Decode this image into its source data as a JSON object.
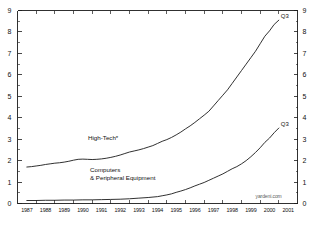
{
  "chart_data": {
    "type": "line",
    "title": "",
    "subtitle": "",
    "xlabel": "",
    "ylabel": "",
    "xlim": [
      1986.5,
      2001.5
    ],
    "ylim": [
      0,
      9
    ],
    "grid": false,
    "legend_position": "inline-annotations",
    "y_ticks": [
      "0",
      "1",
      "2",
      "3",
      "4",
      "5",
      "6",
      "7",
      "8",
      "9"
    ],
    "y_ticks_right": [
      "0",
      "1",
      "2",
      "3",
      "4",
      "5",
      "6",
      "7",
      "8",
      "9"
    ],
    "x_tick_labels": [
      "1987",
      "1988",
      "1989",
      "1990",
      "1991",
      "1992",
      "1993",
      "1994",
      "1995",
      "1996",
      "1997",
      "1998",
      "1999",
      "2000",
      "2001"
    ],
    "series": [
      {
        "name": "High-Tech*",
        "label_text": "High-Tech*",
        "end_label": "Q3",
        "color": "#1a1a1a",
        "x": [
          1987.0,
          1987.25,
          1987.5,
          1987.75,
          1988.0,
          1988.25,
          1988.5,
          1988.75,
          1989.0,
          1989.25,
          1989.5,
          1989.75,
          1990.0,
          1990.25,
          1990.5,
          1990.75,
          1991.0,
          1991.25,
          1991.5,
          1991.75,
          1992.0,
          1992.25,
          1992.5,
          1992.75,
          1993.0,
          1993.25,
          1993.5,
          1993.75,
          1994.0,
          1994.25,
          1994.5,
          1994.75,
          1995.0,
          1995.25,
          1995.5,
          1995.75,
          1996.0,
          1996.25,
          1996.5,
          1996.75,
          1997.0,
          1997.25,
          1997.5,
          1997.75,
          1998.0,
          1998.25,
          1998.5,
          1998.75,
          1999.0,
          1999.25,
          1999.5,
          1999.75,
          2000.0,
          2000.25,
          2000.5
        ],
        "values": [
          1.7,
          1.72,
          1.75,
          1.78,
          1.82,
          1.85,
          1.88,
          1.9,
          1.93,
          1.97,
          2.02,
          2.06,
          2.07,
          2.06,
          2.05,
          2.06,
          2.08,
          2.11,
          2.15,
          2.2,
          2.26,
          2.33,
          2.4,
          2.45,
          2.5,
          2.56,
          2.63,
          2.7,
          2.8,
          2.9,
          2.98,
          3.08,
          3.2,
          3.33,
          3.48,
          3.62,
          3.78,
          3.95,
          4.12,
          4.3,
          4.55,
          4.8,
          5.05,
          5.3,
          5.6,
          5.9,
          6.2,
          6.5,
          6.8,
          7.1,
          7.45,
          7.8,
          8.05,
          8.35,
          8.55
        ]
      },
      {
        "name": "Computers & Peripheral Equipment",
        "label_text": "Computers\n& Peripheral Equipment",
        "label_line1": "Computers",
        "label_line2": "& Peripheral Equipment",
        "end_label": "Q3",
        "color": "#1a1a1a",
        "x": [
          1987.0,
          1987.5,
          1988.0,
          1988.5,
          1989.0,
          1989.5,
          1990.0,
          1990.5,
          1991.0,
          1991.5,
          1992.0,
          1992.5,
          1993.0,
          1993.5,
          1994.0,
          1994.25,
          1994.5,
          1994.75,
          1995.0,
          1995.25,
          1995.5,
          1995.75,
          1996.0,
          1996.25,
          1996.5,
          1996.75,
          1997.0,
          1997.25,
          1997.5,
          1997.75,
          1998.0,
          1998.25,
          1998.5,
          1998.75,
          1999.0,
          1999.25,
          1999.5,
          1999.75,
          2000.0,
          2000.25,
          2000.5
        ],
        "values": [
          0.14,
          0.14,
          0.15,
          0.15,
          0.16,
          0.16,
          0.17,
          0.17,
          0.18,
          0.19,
          0.2,
          0.22,
          0.25,
          0.28,
          0.32,
          0.36,
          0.4,
          0.45,
          0.52,
          0.58,
          0.65,
          0.73,
          0.82,
          0.9,
          0.98,
          1.08,
          1.18,
          1.28,
          1.38,
          1.5,
          1.62,
          1.72,
          1.85,
          2.0,
          2.18,
          2.38,
          2.6,
          2.85,
          3.05,
          3.3,
          3.52
        ]
      }
    ],
    "annotations": [
      {
        "name": "hightech-q3",
        "text": "Q3",
        "x": 2000.5,
        "y": 8.55
      },
      {
        "name": "computers-q3",
        "text": "Q3",
        "x": 2000.5,
        "y": 3.52
      }
    ]
  },
  "watermark": {
    "text": "yardeni.com"
  }
}
